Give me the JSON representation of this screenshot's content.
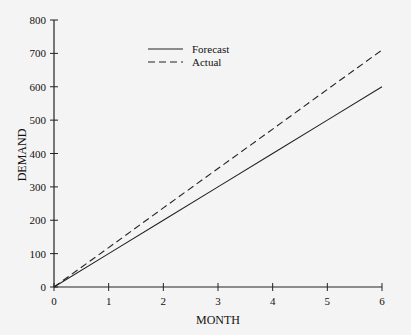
{
  "chart_data": {
    "type": "line",
    "title": "",
    "xlabel": "MONTH",
    "ylabel": "DEMAND",
    "x": [
      0,
      1,
      2,
      3,
      4,
      5,
      6
    ],
    "xlim": [
      0,
      6
    ],
    "ylim": [
      0,
      800
    ],
    "xticks": [
      "0",
      "1",
      "2",
      "3",
      "4",
      "5",
      "6"
    ],
    "yticks": [
      "0",
      "100",
      "200",
      "300",
      "400",
      "500",
      "600",
      "700",
      "800"
    ],
    "grid": false,
    "legend_position": "upper-left-center",
    "series": [
      {
        "name": "Forecast",
        "style": "solid",
        "values": [
          0,
          100,
          200,
          300,
          400,
          500,
          600
        ]
      },
      {
        "name": "Actual",
        "style": "dashed",
        "values": [
          0,
          118,
          237,
          355,
          473,
          592,
          710
        ]
      }
    ]
  }
}
